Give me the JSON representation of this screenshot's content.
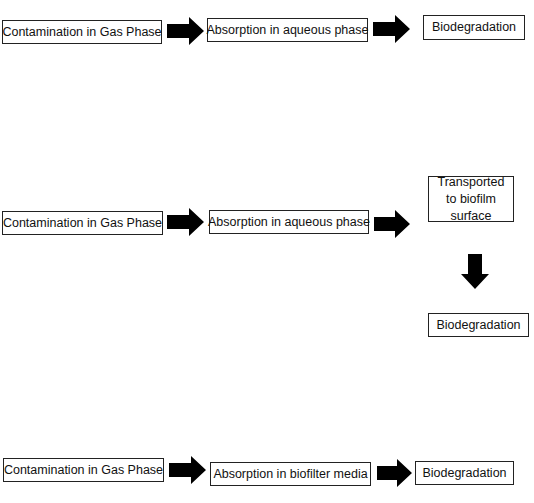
{
  "diagram": {
    "rows": [
      {
        "steps": [
          {
            "label": "Contamination in Gas Phase"
          },
          {
            "label": "Absorption in aqueous phase"
          },
          {
            "label": "Biodegradation"
          }
        ]
      },
      {
        "steps": [
          {
            "label": "Contamination in Gas Phase"
          },
          {
            "label": "Absorption in aqueous phase"
          },
          {
            "label": "Transported to biofilm surface"
          },
          {
            "label": "Biodegradation"
          }
        ]
      },
      {
        "steps": [
          {
            "label": "Contamination in Gas Phase"
          },
          {
            "label": "Absorption in biofilter media"
          },
          {
            "label": "Biodegradation"
          }
        ]
      }
    ],
    "arrow_color": "#000000",
    "box_border_color": "#222222"
  }
}
